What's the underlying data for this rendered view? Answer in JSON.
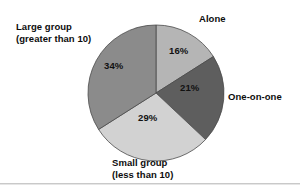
{
  "chart_data": {
    "type": "pie",
    "title": "",
    "subtitle": "",
    "legend_position": "callout-labels",
    "grid": false,
    "categories": [
      "Alone",
      "One-on-one",
      "Small group (less than 10)",
      "Large group (greater than 10)"
    ],
    "values": [
      16,
      21,
      29,
      34
    ],
    "value_labels": [
      "16%",
      "21%",
      "29%",
      "34%"
    ],
    "start_angle_deg": 0,
    "direction": "clockwise",
    "slices": [
      {
        "label": "Alone",
        "label_line1": "Alone",
        "label_line2": "",
        "value": 16,
        "value_label": "16%",
        "color": "#b5b5b5",
        "start_deg": 0,
        "end_deg": 57.6
      },
      {
        "label": "One-on-one",
        "label_line1": "One-on-one",
        "label_line2": "",
        "value": 21,
        "value_label": "21%",
        "color": "#5e5e5e",
        "start_deg": 57.6,
        "end_deg": 133.2
      },
      {
        "label": "Small group (less than 10)",
        "label_line1": "Small group",
        "label_line2": "(less than 10)",
        "value": 29,
        "value_label": "29%",
        "color": "#d2d2d2",
        "start_deg": 133.2,
        "end_deg": 237.6
      },
      {
        "label": "Large group (greater than 10)",
        "label_line1": "Large group",
        "label_line2": "(greater than 10)",
        "value": 34,
        "value_label": "34%",
        "color": "#8b8b8b",
        "start_deg": 237.6,
        "end_deg": 360
      }
    ],
    "geometry": {
      "center_x": 156,
      "center_y": 93,
      "radius": 68
    },
    "colors": {
      "background": "#ffffff",
      "outline": "#4a4a4a",
      "rule": "#c9c9c9",
      "text": "#0d0d0d"
    }
  }
}
